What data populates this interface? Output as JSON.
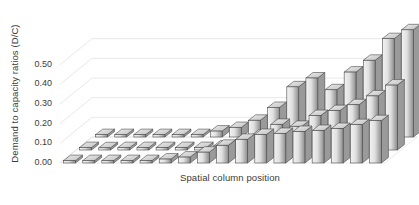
{
  "chart_data": {
    "type": "bar",
    "subtype": "3d-column",
    "title": "",
    "xlabel": "Spatial column position",
    "ylabel": "Demand to capacity ratios (D/C)",
    "ylim": [
      0.0,
      0.6
    ],
    "ytick_labels": [
      "0.00",
      "0.10",
      "0.20",
      "0.30",
      "0.40",
      "0.50"
    ],
    "ytick_values": [
      0.0,
      0.1,
      0.2,
      0.3,
      0.4,
      0.5
    ],
    "grid": true,
    "legend": "none",
    "xtick_labels": [],
    "categories": [
      "1",
      "2",
      "3",
      "4",
      "5",
      "6",
      "7",
      "8",
      "9",
      "10",
      "11",
      "12",
      "13",
      "14",
      "15",
      "16",
      "17"
    ],
    "series": [
      {
        "name": "Back row",
        "values": [
          0.012,
          0.012,
          0.012,
          0.012,
          0.012,
          0.012,
          0.03,
          0.048,
          0.085,
          0.15,
          0.255,
          0.3,
          0.24,
          0.33,
          0.39,
          0.5,
          0.545
        ]
      },
      {
        "name": "Middle row",
        "values": [
          0.012,
          0.0,
          0.012,
          0.012,
          0.012,
          0.012,
          0.012,
          0.02,
          0.04,
          0.075,
          0.13,
          0.12,
          0.175,
          0.2,
          0.23,
          0.275,
          0.33
        ]
      },
      {
        "name": "Front row",
        "values": [
          0.012,
          0.012,
          0.012,
          0.012,
          0.012,
          0.02,
          0.03,
          0.055,
          0.09,
          0.12,
          0.145,
          0.15,
          0.16,
          0.165,
          0.175,
          0.195,
          0.215
        ]
      }
    ],
    "colors": {
      "bar_face_light": "#f2f2f2",
      "bar_face_dark": "#8d8d8d",
      "bar_top": "#d9d9d9",
      "bar_side": "#9a9a9a",
      "bar_outline": "#4a4a4a",
      "gridline": "#e8e8e8",
      "floor": "#fcfcfc",
      "text": "#3b3b3b",
      "background": "#ffffff"
    }
  }
}
